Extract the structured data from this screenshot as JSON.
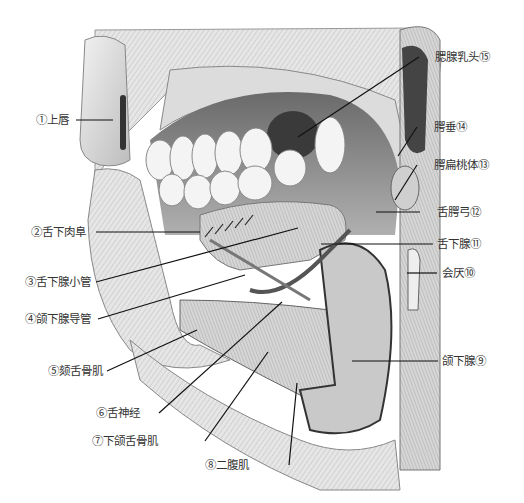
{
  "figure": {
    "labels_left": [
      {
        "id": 1,
        "text": "①上唇"
      },
      {
        "id": 2,
        "text": "②舌下肉阜"
      },
      {
        "id": 3,
        "text": "③舌下腺小管"
      },
      {
        "id": 4,
        "text": "④颌下腺导管"
      },
      {
        "id": 5,
        "text": "⑤颏舌骨肌"
      },
      {
        "id": 6,
        "text": "⑥舌神经"
      },
      {
        "id": 7,
        "text": "⑦下颌舌骨肌"
      },
      {
        "id": 8,
        "text": "⑧二腹肌"
      }
    ],
    "labels_right": [
      {
        "id": 15,
        "text": "腮腺乳头⑮"
      },
      {
        "id": 14,
        "text": "腭垂⑭"
      },
      {
        "id": 13,
        "text": "腭扁桃体⑬"
      },
      {
        "id": 12,
        "text": "舌腭弓⑫"
      },
      {
        "id": 11,
        "text": "舌下腺⑪"
      },
      {
        "id": 10,
        "text": "会厌⑩"
      },
      {
        "id": 9,
        "text": "颌下腺⑨"
      }
    ]
  }
}
